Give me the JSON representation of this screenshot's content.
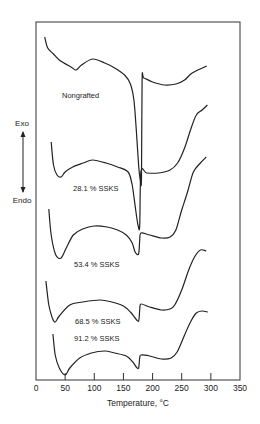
{
  "chart_data": {
    "type": "line",
    "title": "",
    "xlabel": "Temperature, °C",
    "ylabel": "",
    "xlim": [
      0,
      350
    ],
    "x_ticks": [
      0,
      50,
      100,
      150,
      200,
      250,
      300,
      350
    ],
    "x_tick_labels": [
      "0",
      "50",
      "100",
      "150",
      "200",
      "250",
      "300",
      "350"
    ],
    "y_ticks": [],
    "grid": false,
    "legend": "inline labels",
    "y_direction": {
      "up": "Exo",
      "down": "Endo"
    },
    "note": "DSC thermograms; y values are relative heat-flow offsets (screen px, arbitrary units, stacked curves)",
    "series": [
      {
        "name": "Nongrafted",
        "label_pos": [
          62,
          98
        ],
        "points": [
          [
            15,
            37
          ],
          [
            20,
            48
          ],
          [
            30,
            54
          ],
          [
            40,
            60
          ],
          [
            60,
            67
          ],
          [
            69,
            70
          ],
          [
            78,
            65
          ],
          [
            97,
            59
          ],
          [
            118,
            63
          ],
          [
            135,
            68
          ],
          [
            152,
            75
          ],
          [
            162,
            84
          ],
          [
            168,
            100
          ],
          [
            172,
            130
          ],
          [
            176,
            165
          ],
          [
            179,
            180
          ],
          [
            181,
            178
          ],
          [
            182,
            80
          ],
          [
            185,
            78
          ],
          [
            200,
            82
          ],
          [
            220,
            85
          ],
          [
            240,
            84
          ],
          [
            255,
            80
          ],
          [
            268,
            73
          ],
          [
            293,
            66
          ]
        ]
      },
      {
        "name": "28.1 % SSKS",
        "label_pos": [
          73,
          191
        ],
        "points": [
          [
            26,
            142
          ],
          [
            30,
            165
          ],
          [
            36,
            175
          ],
          [
            43,
            177
          ],
          [
            50,
            172
          ],
          [
            63,
            167
          ],
          [
            81,
            163
          ],
          [
            97,
            160
          ],
          [
            120,
            163
          ],
          [
            140,
            167
          ],
          [
            158,
            172
          ],
          [
            165,
            185
          ],
          [
            171,
            210
          ],
          [
            175,
            225
          ],
          [
            178,
            226
          ],
          [
            180,
            172
          ],
          [
            190,
            173
          ],
          [
            210,
            173
          ],
          [
            230,
            170
          ],
          [
            243,
            163
          ],
          [
            255,
            148
          ],
          [
            265,
            130
          ],
          [
            275,
            115
          ],
          [
            285,
            110
          ],
          [
            294,
            105
          ]
        ]
      },
      {
        "name": "53.4 % SSKS",
        "label_pos": [
          74,
          267
        ],
        "points": [
          [
            22,
            209
          ],
          [
            26,
            235
          ],
          [
            34,
            255
          ],
          [
            43,
            258
          ],
          [
            52,
            248
          ],
          [
            64,
            235
          ],
          [
            80,
            229
          ],
          [
            100,
            226
          ],
          [
            122,
            227
          ],
          [
            140,
            230
          ],
          [
            155,
            235
          ],
          [
            165,
            243
          ],
          [
            170,
            252
          ],
          [
            176,
            254
          ],
          [
            178,
            240
          ],
          [
            180,
            233
          ],
          [
            195,
            235
          ],
          [
            215,
            238
          ],
          [
            230,
            237
          ],
          [
            240,
            230
          ],
          [
            250,
            210
          ],
          [
            260,
            192
          ],
          [
            270,
            172
          ],
          [
            282,
            163
          ],
          [
            292,
            157
          ]
        ]
      },
      {
        "name": "68.5 % SSKS",
        "label_pos": [
          75,
          324
        ],
        "points": [
          [
            17,
            281
          ],
          [
            22,
            305
          ],
          [
            28,
            318
          ],
          [
            33,
            322
          ],
          [
            40,
            316
          ],
          [
            58,
            305
          ],
          [
            80,
            302
          ],
          [
            110,
            300
          ],
          [
            130,
            302
          ],
          [
            150,
            306
          ],
          [
            162,
            312
          ],
          [
            170,
            318
          ],
          [
            176,
            321
          ],
          [
            178,
            310
          ],
          [
            180,
            304
          ],
          [
            195,
            307
          ],
          [
            215,
            310
          ],
          [
            230,
            309
          ],
          [
            238,
            305
          ],
          [
            250,
            290
          ],
          [
            262,
            270
          ],
          [
            272,
            257
          ],
          [
            282,
            250
          ],
          [
            292,
            251
          ]
        ]
      },
      {
        "name": "91.2 % SSKS",
        "label_pos": [
          74,
          341
        ],
        "points": [
          [
            29,
            334
          ],
          [
            33,
            355
          ],
          [
            40,
            368
          ],
          [
            50,
            375
          ],
          [
            58,
            368
          ],
          [
            75,
            358
          ],
          [
            95,
            353
          ],
          [
            118,
            351
          ],
          [
            135,
            353
          ],
          [
            155,
            356
          ],
          [
            166,
            362
          ],
          [
            172,
            367
          ],
          [
            176,
            368
          ],
          [
            178,
            358
          ],
          [
            180,
            355
          ],
          [
            195,
            356
          ],
          [
            215,
            359
          ],
          [
            232,
            358
          ],
          [
            242,
            352
          ],
          [
            255,
            335
          ],
          [
            265,
            322
          ],
          [
            275,
            313
          ],
          [
            285,
            311
          ],
          [
            295,
            312
          ]
        ]
      }
    ]
  },
  "layout": {
    "frame": {
      "left": 36,
      "top": 22,
      "right": 240,
      "bottom": 380
    },
    "x_px_per_unit": 0.583,
    "line_color": "#222222",
    "frame_color": "#333333"
  },
  "axis_annotations": {
    "exo_label": "Exo",
    "endo_label": "Endo"
  }
}
